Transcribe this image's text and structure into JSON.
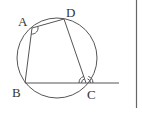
{
  "diagram": {
    "type": "cyclic-quadrilateral",
    "circle": {
      "cx": 57,
      "cy": 58,
      "r": 40
    },
    "points": {
      "A": {
        "label": "A",
        "x": 32,
        "y": 28,
        "lx": 18,
        "ly": 26
      },
      "D": {
        "label": "D",
        "x": 64,
        "y": 19,
        "lx": 66,
        "ly": 17
      },
      "B": {
        "label": "B",
        "x": 25,
        "y": 83,
        "lx": 12,
        "ly": 97
      },
      "C": {
        "label": "C",
        "x": 86,
        "y": 83,
        "lx": 87,
        "ly": 99
      }
    },
    "extension_line": {
      "from": "B",
      "to_x": 119
    },
    "angle_marks": [
      "angle A (single arc)",
      "angle BCD (double arc)",
      "exterior angle at C (double arc)"
    ],
    "colors": {
      "line": "#555555",
      "label": "#333333",
      "border": "#666666"
    }
  }
}
